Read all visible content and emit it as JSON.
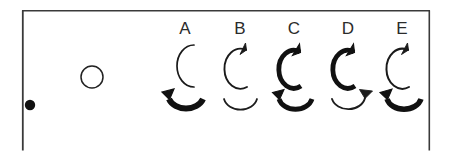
{
  "figure": {
    "title": "",
    "background_color": "#ffffff",
    "ink_color": "#111111",
    "border": {
      "name": "panel-border",
      "color": "#3a3a3a",
      "stroke_width": 1.6,
      "x": 22,
      "y": 10,
      "width": 408,
      "height": 140,
      "edges_drawn": [
        "left",
        "top",
        "right"
      ]
    },
    "legend": {
      "filled_dot": {
        "icon": "filled-dot-icon",
        "label": "",
        "cx": 30,
        "cy": 105,
        "r": 5.2,
        "fill": "#111111"
      },
      "open_circle": {
        "icon": "open-circle-icon",
        "label": "",
        "cx": 92,
        "cy": 77,
        "r": 11,
        "stroke": "#222222",
        "stroke_width": 1.4,
        "fill": "none"
      }
    },
    "columns": [
      {
        "id": "A",
        "label": "A",
        "center_x": 185,
        "top_symbol": {
          "name": "arc-open-right-no-arrowhead",
          "stroke_width": 1.6,
          "arrowhead": "none",
          "direction": "none",
          "orientation": "opens-right"
        },
        "bottom_symbol": {
          "name": "arc-u-bold-arrow-left",
          "stroke_width": 5.6,
          "arrowhead": "left-end",
          "direction": "counterclockwise",
          "orientation": "opens-up"
        }
      },
      {
        "id": "B",
        "label": "B",
        "center_x": 240,
        "top_symbol": {
          "name": "arc-thin-arrow-top",
          "stroke_width": 1.7,
          "arrowhead": "top-end",
          "direction": "counterclockwise",
          "orientation": "opens-right"
        },
        "bottom_symbol": {
          "name": "arc-u-thin-no-arrowhead",
          "stroke_width": 1.6,
          "arrowhead": "none",
          "direction": "none",
          "orientation": "opens-up"
        }
      },
      {
        "id": "C",
        "label": "C",
        "center_x": 294,
        "top_symbol": {
          "name": "arc-bold-arrow-top",
          "stroke_width": 4.6,
          "arrowhead": "top-end",
          "direction": "counterclockwise",
          "orientation": "opens-right"
        },
        "bottom_symbol": {
          "name": "arc-u-bold-arrow-left",
          "stroke_width": 4.6,
          "arrowhead": "left-end",
          "direction": "counterclockwise",
          "orientation": "opens-up"
        }
      },
      {
        "id": "D",
        "label": "D",
        "center_x": 348,
        "top_symbol": {
          "name": "arc-bold-arrow-top",
          "stroke_width": 4.6,
          "arrowhead": "top-end",
          "direction": "counterclockwise",
          "orientation": "opens-right"
        },
        "bottom_symbol": {
          "name": "arc-u-thin-arrow-right",
          "stroke_width": 1.8,
          "arrowhead": "right-end",
          "direction": "clockwise",
          "orientation": "opens-up"
        }
      },
      {
        "id": "E",
        "label": "E",
        "center_x": 402,
        "top_symbol": {
          "name": "arc-thin-arrow-top",
          "stroke_width": 1.9,
          "arrowhead": "top-end",
          "direction": "counterclockwise",
          "orientation": "opens-right"
        },
        "bottom_symbol": {
          "name": "arc-u-bold-arrow-left",
          "stroke_width": 5.2,
          "arrowhead": "left-end",
          "direction": "counterclockwise",
          "orientation": "opens-up"
        }
      }
    ],
    "rows": {
      "letter_baseline_y": 34,
      "top_symbol_center_y": 66,
      "bottom_symbol_center_y": 108
    }
  }
}
